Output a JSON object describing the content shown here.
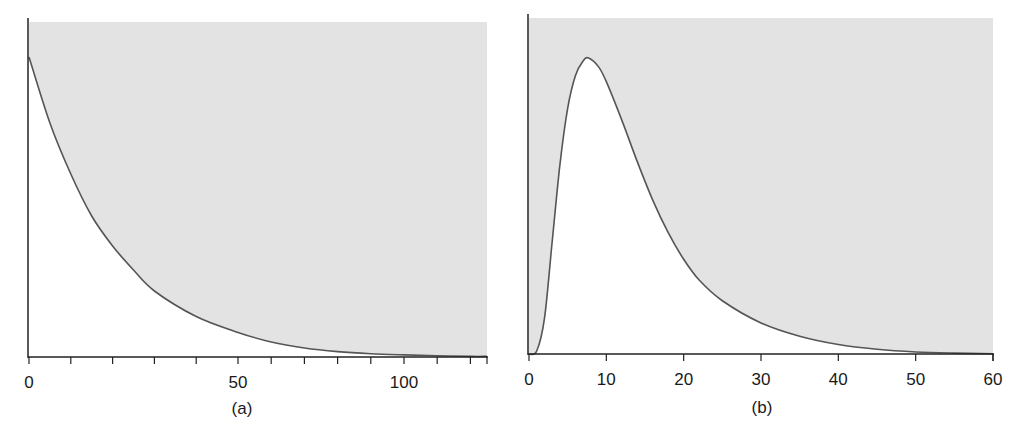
{
  "colors": {
    "shade": "#e3e3e3",
    "curve": "#555555",
    "axis": "#222222",
    "background": "#ffffff"
  },
  "chart_data": [
    {
      "type": "area",
      "title": "",
      "panel_label": "(a)",
      "xlabel": "",
      "ylabel": "",
      "xlim": [
        0,
        125
      ],
      "ylim": [
        0,
        1.1
      ],
      "grid": false,
      "legend": null,
      "shading": "region above curve shaded grey; region below curve white",
      "x_tick_labels": [
        "0",
        "50",
        "100"
      ],
      "x_tick_positions": [
        0,
        10,
        20,
        30,
        40,
        50,
        60,
        70,
        80,
        90,
        100,
        110,
        120
      ],
      "series": [
        {
          "name": "exponential decay",
          "x": [
            0,
            5,
            10,
            15,
            20,
            25,
            30,
            40,
            50,
            60,
            70,
            80,
            90,
            100,
            110,
            120
          ],
          "values": [
            1.0,
            0.78,
            0.61,
            0.47,
            0.37,
            0.29,
            0.22,
            0.135,
            0.082,
            0.05,
            0.03,
            0.018,
            0.011,
            0.007,
            0.004,
            0.002
          ]
        }
      ]
    },
    {
      "type": "area",
      "title": "",
      "panel_label": "(b)",
      "xlabel": "",
      "ylabel": "",
      "xlim": [
        0,
        60
      ],
      "ylim": [
        0,
        1.05
      ],
      "grid": false,
      "legend": null,
      "shading": "region above curve shaded grey; region below curve white",
      "x_tick_labels": [
        "0",
        "10",
        "20",
        "30",
        "40",
        "50",
        "60"
      ],
      "x_tick_positions": [
        0,
        10,
        20,
        30,
        40,
        50,
        60
      ],
      "series": [
        {
          "name": "skewed peak (rise then decay)",
          "x": [
            0,
            1,
            2,
            3,
            4,
            5,
            6,
            7,
            7.7,
            9,
            10,
            12,
            14,
            16,
            18,
            20,
            22,
            25,
            30,
            35,
            40,
            45,
            50,
            55,
            60
          ],
          "values": [
            0.0,
            0.01,
            0.12,
            0.38,
            0.64,
            0.83,
            0.94,
            0.99,
            1.0,
            0.97,
            0.92,
            0.79,
            0.65,
            0.52,
            0.41,
            0.32,
            0.25,
            0.18,
            0.105,
            0.06,
            0.032,
            0.016,
            0.007,
            0.003,
            0.001
          ]
        }
      ]
    }
  ]
}
